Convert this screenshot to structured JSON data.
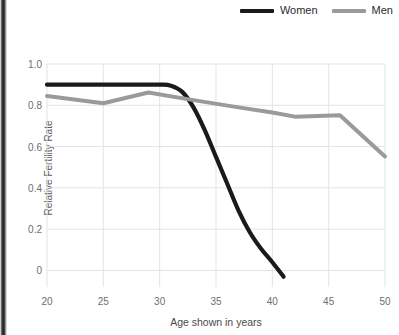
{
  "chart_data": {
    "type": "line",
    "title": "",
    "xlabel": "Age shown in years",
    "ylabel": "Relative Fertility Rate",
    "xlim": [
      20,
      50
    ],
    "ylim": [
      0,
      1.0
    ],
    "yaxis_bottom_value": -0.08,
    "grid": true,
    "legend_position": "top-right",
    "xticks": [
      20,
      25,
      30,
      35,
      40,
      45,
      50
    ],
    "xtick_labels": [
      "20",
      "25",
      "30",
      "35",
      "40",
      "45",
      "50"
    ],
    "yticks": [
      0,
      0.2,
      0.4,
      0.6,
      0.8,
      1.0
    ],
    "ytick_labels": [
      "0",
      "0.2",
      "0.4",
      "0.6",
      "0.8",
      "1.0"
    ],
    "series": [
      {
        "name": "Women",
        "color": "#1a1a1a",
        "x": [
          20,
          24,
          28,
          30,
          31,
          32,
          33,
          34,
          35,
          36,
          37,
          38,
          39,
          40,
          41
        ],
        "values": [
          0.9,
          0.9,
          0.9,
          0.9,
          0.895,
          0.865,
          0.79,
          0.68,
          0.55,
          0.42,
          0.29,
          0.185,
          0.105,
          0.04,
          -0.03
        ]
      },
      {
        "name": "Men",
        "color": "#9a9a9a",
        "x": [
          20,
          25,
          29,
          33,
          37,
          40,
          42,
          46,
          50
        ],
        "values": [
          0.845,
          0.81,
          0.862,
          0.825,
          0.79,
          0.765,
          0.745,
          0.752,
          0.552
        ]
      }
    ]
  },
  "legend": {
    "items": [
      {
        "label": "Women",
        "color": "#1a1a1a"
      },
      {
        "label": "Men",
        "color": "#9a9a9a"
      }
    ]
  }
}
